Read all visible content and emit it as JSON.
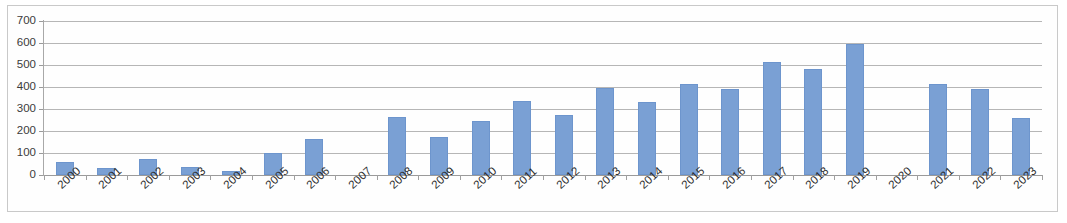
{
  "chart_data": {
    "type": "bar",
    "title": "",
    "subtitle": "",
    "xlabel": "",
    "ylabel": "",
    "categories": [
      "2000",
      "2001",
      "2002",
      "2003",
      "2004",
      "2005",
      "2006",
      "2007",
      "2008",
      "2009",
      "2010",
      "2011",
      "2012",
      "2013",
      "2014",
      "2015",
      "2016",
      "2017",
      "2018",
      "2019",
      "2020",
      "2021",
      "2022",
      "2023"
    ],
    "values": [
      60,
      30,
      75,
      35,
      20,
      100,
      165,
      0,
      265,
      175,
      245,
      335,
      275,
      395,
      330,
      415,
      390,
      515,
      480,
      597,
      0,
      415,
      390,
      260
    ],
    "series": [
      {
        "name": "Series 1",
        "values": [
          60,
          30,
          75,
          35,
          20,
          100,
          165,
          0,
          265,
          175,
          245,
          335,
          275,
          395,
          330,
          415,
          390,
          515,
          480,
          597,
          0,
          415,
          390,
          260
        ]
      }
    ],
    "ylim": [
      0,
      700
    ],
    "ytick_labels": [
      "700",
      "600",
      "500",
      "400",
      "300",
      "200",
      "100",
      "0"
    ],
    "ytick_values": [
      700,
      600,
      500,
      400,
      300,
      200,
      100,
      0
    ],
    "ystep": 100,
    "grid": true,
    "grid_axis": "y",
    "legend": false,
    "legend_position": "none",
    "bar_color": "#7aa0d4",
    "bar_border_color": "#6d95cd",
    "gridline_color": "#b6b6b6",
    "axis_color": "#9a9a9a",
    "plot_background": "#fefefe",
    "xtick_label_rotation": -42,
    "annotations": []
  }
}
